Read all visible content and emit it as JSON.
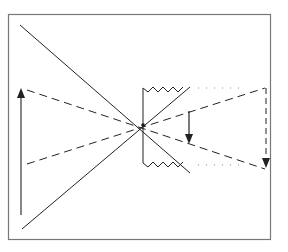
{
  "diagram": {
    "elements": {
      "frame": "border",
      "object_arrow": {
        "direction": "up"
      },
      "image_arrow_near": {
        "direction": "down"
      },
      "image_arrow_far": {
        "direction": "down",
        "style": "dashed"
      },
      "aperture": {
        "edges": "zigzag"
      },
      "rays": [
        "solid-diagonal-1",
        "solid-diagonal-2",
        "dashed-upper",
        "dashed-lower"
      ],
      "dotted_extensions": 2
    },
    "colors": {
      "line": "#222222",
      "frame": "#777777",
      "background": "#ffffff"
    }
  }
}
